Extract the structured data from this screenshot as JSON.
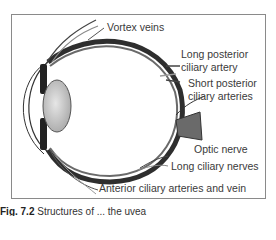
{
  "figure": {
    "labels": {
      "vortex_veins": "Vortex veins",
      "long_posterior_1": "Long posterior",
      "long_posterior_2": "ciliary artery",
      "short_posterior_1": "Short posterior",
      "short_posterior_2": "ciliary arteries",
      "optic_nerve": "Optic nerve",
      "long_ciliary_nerves": "Long ciliary nerves",
      "anterior_ciliary": "Anterior ciliary arteries and vein"
    },
    "caption": {
      "number": "Fig. 7.2",
      "text": "Structures of ... the uvea"
    },
    "colors": {
      "sclera": "#3a3a3a",
      "choroid": "#5a5a5a",
      "lens": "#c8c8c8",
      "optic_nerve": "#6a6a6a",
      "frame": "#8a8a8a",
      "text": "#3a3a3a"
    }
  }
}
